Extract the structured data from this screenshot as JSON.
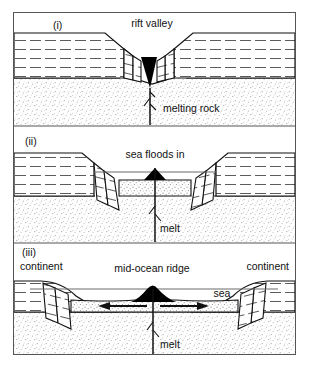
{
  "figure": {
    "caption": "",
    "frame": {
      "x": 13,
      "y": 12,
      "width": 283,
      "height": 343,
      "border_color": "#555555"
    }
  },
  "colors": {
    "ink": "#111111",
    "frame": "#555555",
    "sea_line": "#6b6b6b",
    "magma_fill": "#000000",
    "stipple": "#9a9a9a",
    "layer_dash": "#4a4a4a",
    "background": "#ffffff"
  },
  "panels": [
    {
      "id": "panel-i",
      "number": "(i)",
      "stage": "rift valley stage",
      "labels": [
        {
          "name": "rift-valley-label",
          "text": "rift valley",
          "x": 152,
          "y": 27,
          "anchor": "middle"
        },
        {
          "name": "melting-rock-label",
          "text": "melting rock",
          "x": 163,
          "y": 112,
          "anchor": "start"
        }
      ],
      "features": [
        "rift valley",
        "normal fault blocks",
        "magma wedge",
        "melting rock feeder dyke",
        "dashed sedimentary layers",
        "stippled mantle"
      ]
    },
    {
      "id": "panel-ii",
      "number": "(ii)",
      "stage": "sea floods in stage",
      "labels": [
        {
          "name": "sea-floods-in-label",
          "text": "sea floods in",
          "x": 155,
          "y": 158,
          "anchor": "middle"
        },
        {
          "name": "melt-label-ii",
          "text": "melt",
          "x": 160,
          "y": 232,
          "anchor": "start"
        }
      ],
      "features": [
        "narrow sea",
        "tilted fault blocks",
        "magma wedge",
        "melt feeder dyke",
        "new ocean floor"
      ]
    },
    {
      "id": "panel-iii",
      "number": "(iii)",
      "stage": "mid-ocean ridge stage",
      "labels": [
        {
          "name": "continent-label-left",
          "text": "continent",
          "x": 20,
          "y": 270,
          "anchor": "start"
        },
        {
          "name": "continent-label-right",
          "text": "continent",
          "x": 289,
          "y": 270,
          "anchor": "end"
        },
        {
          "name": "mid-ocean-ridge-label",
          "text": "mid-ocean ridge",
          "x": 152,
          "y": 272,
          "anchor": "middle"
        },
        {
          "name": "sea-label",
          "text": "sea",
          "x": 222,
          "y": 297,
          "anchor": "middle"
        },
        {
          "name": "melt-label-iii",
          "text": "melt",
          "x": 160,
          "y": 348,
          "anchor": "start"
        }
      ],
      "features": [
        "mid-ocean ridge",
        "spreading arrows",
        "passive continental margins",
        "sea",
        "melt feeder dyke"
      ],
      "spreading_arrows": [
        {
          "name": "spreading-arrow-left",
          "direction": "left"
        },
        {
          "name": "spreading-arrow-right",
          "direction": "right"
        }
      ]
    }
  ]
}
